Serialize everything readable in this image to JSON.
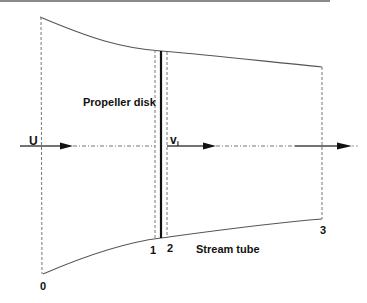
{
  "diagram": {
    "labels": {
      "freestream": "U",
      "disk": "Propeller disk",
      "induced_velocity_main": "v",
      "induced_velocity_sub": "i",
      "stream_tube": "Stream tube",
      "stations": [
        "0",
        "1",
        "2",
        "3"
      ]
    },
    "colors": {
      "line": "#555555",
      "disk": "#111111",
      "dashed": "#777777",
      "text": "#111111",
      "top_border": "#888888"
    },
    "stations_x": {
      "0": 42,
      "1": 155,
      "2": 167,
      "3": 322
    },
    "disk_x": 161,
    "axis_y": 146
  }
}
